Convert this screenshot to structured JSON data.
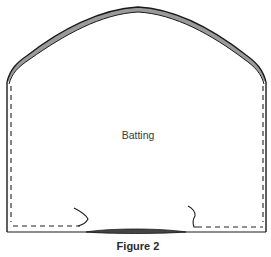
{
  "figure": {
    "region_label": "Batting",
    "caption": "Figure 2"
  },
  "colors": {
    "outline": "#1a1a1a",
    "fill_band": "#9a9a9a",
    "dashed": "#222222",
    "background": "#ffffff"
  }
}
